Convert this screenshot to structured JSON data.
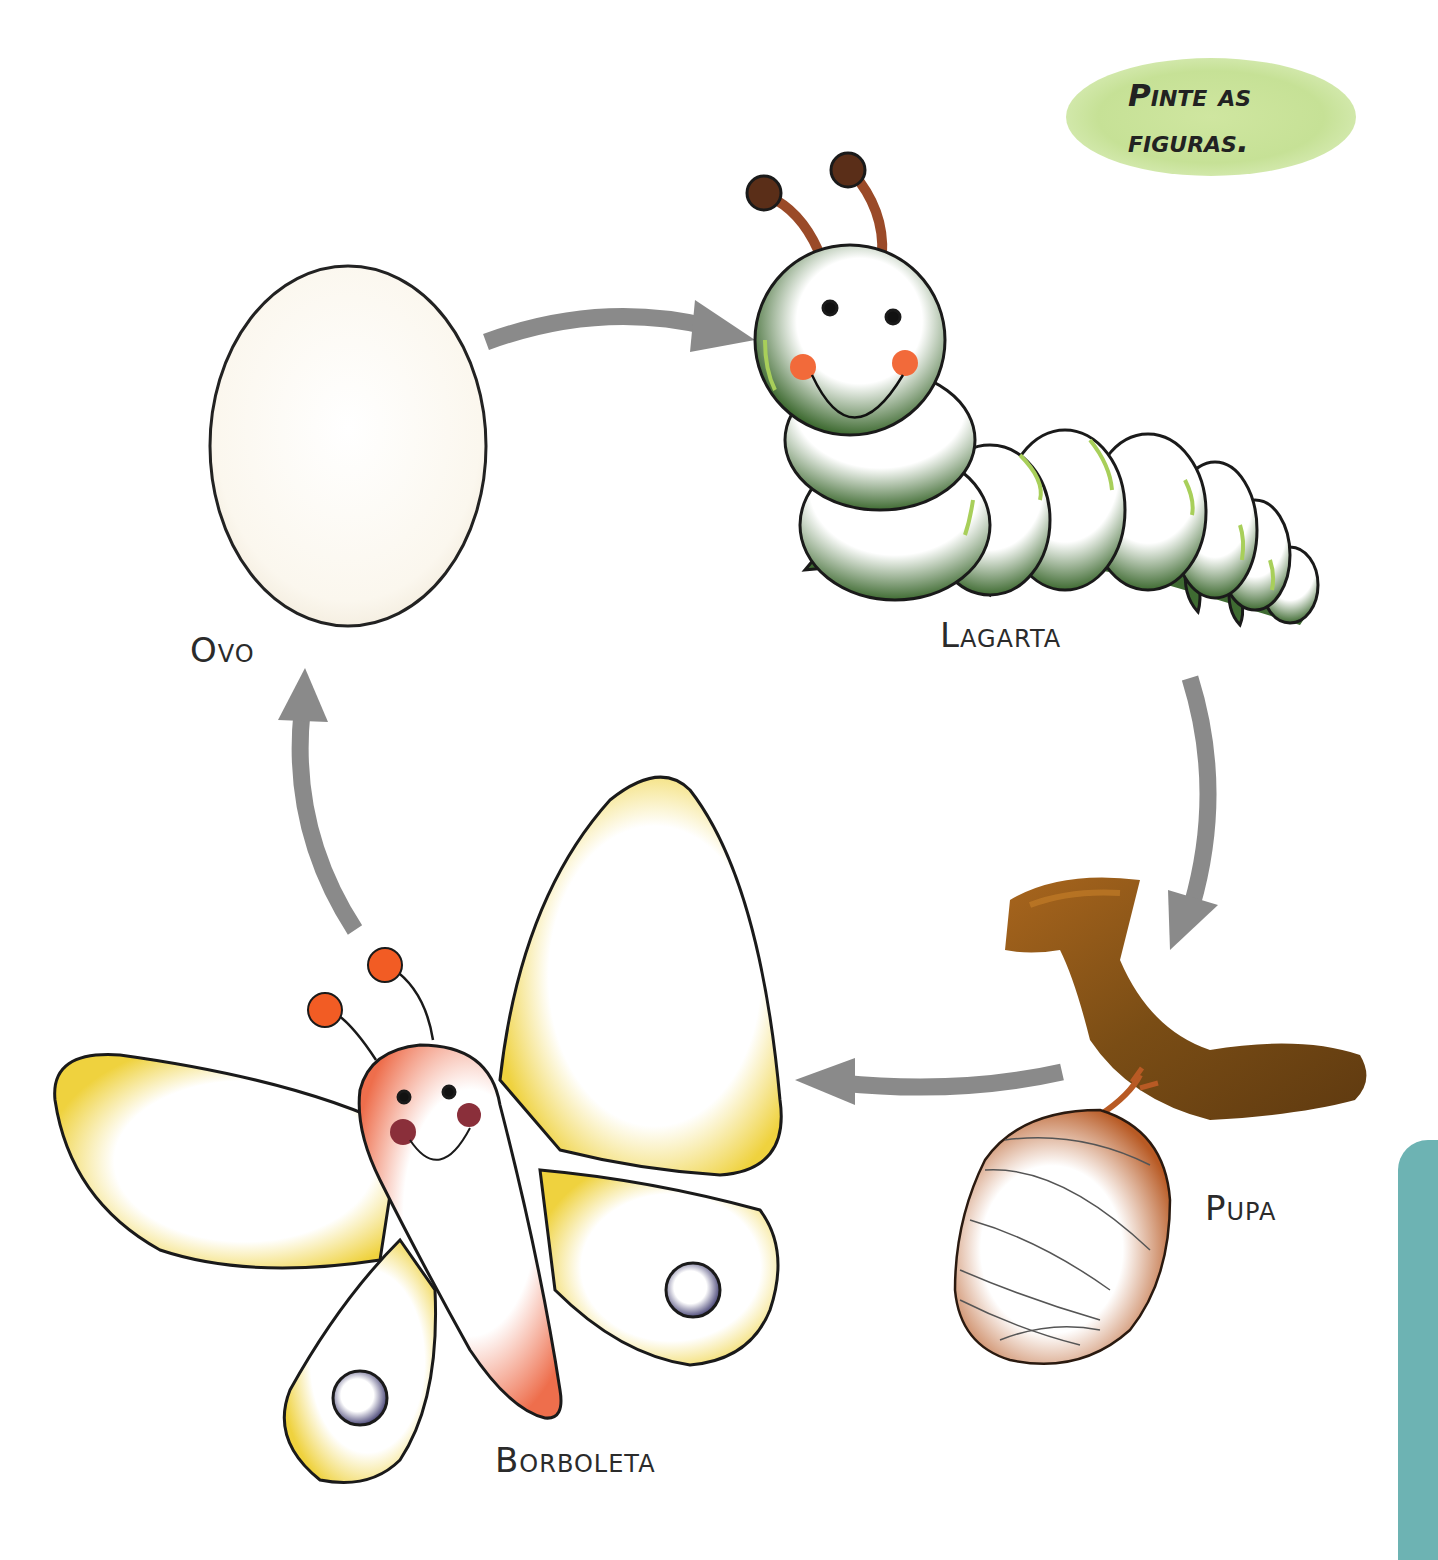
{
  "instruction_badge": {
    "line1": "Pinte as",
    "line2": "figuras.",
    "color": "#c6e196"
  },
  "stages": [
    {
      "id": "egg",
      "label": "Ovo"
    },
    {
      "id": "caterpillar",
      "label": "Lagarta"
    },
    {
      "id": "pupa",
      "label": "Pupa"
    },
    {
      "id": "butterfly",
      "label": "Borboleta"
    }
  ],
  "colors": {
    "arrow": "#8a8a8a",
    "egg_fill": "#fdfaf3",
    "caterpillar_green": "#3f6b32",
    "caterpillar_highlight": "#a8cf5a",
    "antenna_brown": "#9a4a28",
    "antenna_tip": "#5a2e18",
    "cheek_orange": "#f26a3a",
    "pupa_branch": "#7a4d15",
    "pupa_cocoon": "#c0662c",
    "butterfly_wing": "#f1d54a",
    "butterfly_body": "#f07a5a",
    "butterfly_cheek": "#8a2f3a",
    "wing_spot": "#4d4a7a",
    "side_tab": "#6db3b3"
  }
}
